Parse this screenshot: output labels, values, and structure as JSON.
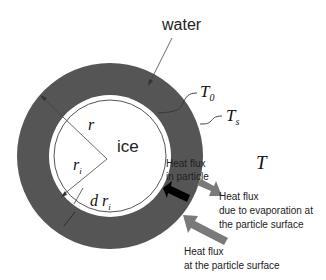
{
  "labels": {
    "water": "water",
    "ice": "ice",
    "T0": "T",
    "T0_sub": "0",
    "Ts": "T",
    "Ts_sub": "s",
    "T_ambient": "T",
    "r": "r",
    "ri": "r",
    "ri_sub": "i",
    "dri": "d r",
    "dri_sub": "i"
  },
  "annotations": {
    "flux_particle_line1": "Heat flux",
    "flux_particle_line2": "in particle",
    "flux_evap_line1": "Heat flux",
    "flux_evap_line2": "due to evaporation at",
    "flux_evap_line3": "the  particle surface",
    "flux_surface_line1": "Heat flux",
    "flux_surface_line2": "at the  particle surface"
  },
  "colors": {
    "water": "#555555",
    "ice": "#ffffff",
    "arrow_gray": "#7a7a7a",
    "arrow_black": "#000000"
  }
}
